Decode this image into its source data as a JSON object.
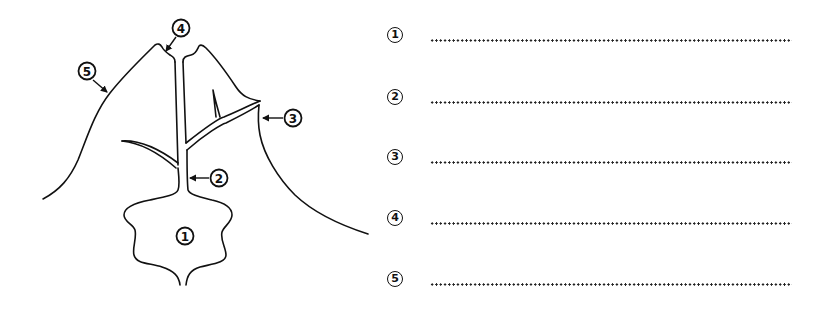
{
  "diagram": {
    "callouts": [
      {
        "id": "1",
        "label": "1",
        "cx": 185,
        "cy": 236,
        "arrow": null
      },
      {
        "id": "2",
        "label": "2",
        "cx": 219,
        "cy": 178,
        "arrow": {
          "x1": 209,
          "y1": 178,
          "x2": 190,
          "y2": 178
        }
      },
      {
        "id": "3",
        "label": "3",
        "cx": 293,
        "cy": 118,
        "arrow": {
          "x1": 283,
          "y1": 118,
          "x2": 263,
          "y2": 118
        }
      },
      {
        "id": "4",
        "label": "4",
        "cx": 181,
        "cy": 28,
        "arrow": {
          "x1": 176,
          "y1": 37,
          "x2": 166,
          "y2": 51
        }
      },
      {
        "id": "5",
        "label": "5",
        "cx": 87,
        "cy": 71,
        "arrow": {
          "x1": 93,
          "y1": 80,
          "x2": 107,
          "y2": 92
        }
      }
    ],
    "stroke_color": "#111111"
  },
  "answers": {
    "rows": [
      {
        "number": "1",
        "value": ""
      },
      {
        "number": "2",
        "value": ""
      },
      {
        "number": "3",
        "value": ""
      },
      {
        "number": "4",
        "value": ""
      },
      {
        "number": "5",
        "value": ""
      }
    ],
    "dot_color": "#222222"
  }
}
